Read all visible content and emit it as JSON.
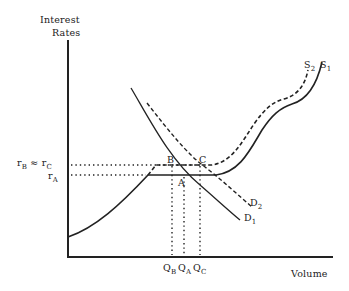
{
  "diagram": {
    "y_axis_label_line1": "Interest",
    "y_axis_label_line2": "Rates",
    "x_axis_label": "Volume",
    "rate_labels": {
      "rb_main": "r",
      "rb_sub": "B",
      "approx": "≈",
      "rc_main": "r",
      "rc_sub": "C",
      "ra_main": "r",
      "ra_sub": "A"
    },
    "points": {
      "B": "B",
      "C": "C",
      "A": "A"
    },
    "curves": {
      "S1": {
        "main": "S",
        "sub": "1",
        "style": "solid"
      },
      "S2": {
        "main": "S",
        "sub": "2",
        "style": "dashed"
      },
      "D1": {
        "main": "D",
        "sub": "1",
        "style": "solid"
      },
      "D2": {
        "main": "D",
        "sub": "2",
        "style": "dashed"
      }
    },
    "quantity_labels": {
      "QB": {
        "main": "Q",
        "sub": "B"
      },
      "QA": {
        "main": "Q",
        "sub": "A"
      },
      "QC": {
        "main": "Q",
        "sub": "C"
      }
    },
    "colors": {
      "ink": "#222222",
      "background": "#ffffff"
    }
  }
}
